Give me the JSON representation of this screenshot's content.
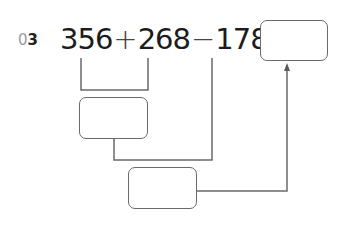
{
  "problem": {
    "number_prefix": "0",
    "number": "3",
    "terms": [
      "356",
      "268",
      "178"
    ],
    "operators": [
      "+",
      "−",
      "="
    ],
    "answer_box": "",
    "intermediate_box_1": "",
    "intermediate_box_2": ""
  },
  "colors": {
    "line": "#6a6a6a",
    "text": "#1c1c1c",
    "label_prefix": "#9a9a9a"
  }
}
